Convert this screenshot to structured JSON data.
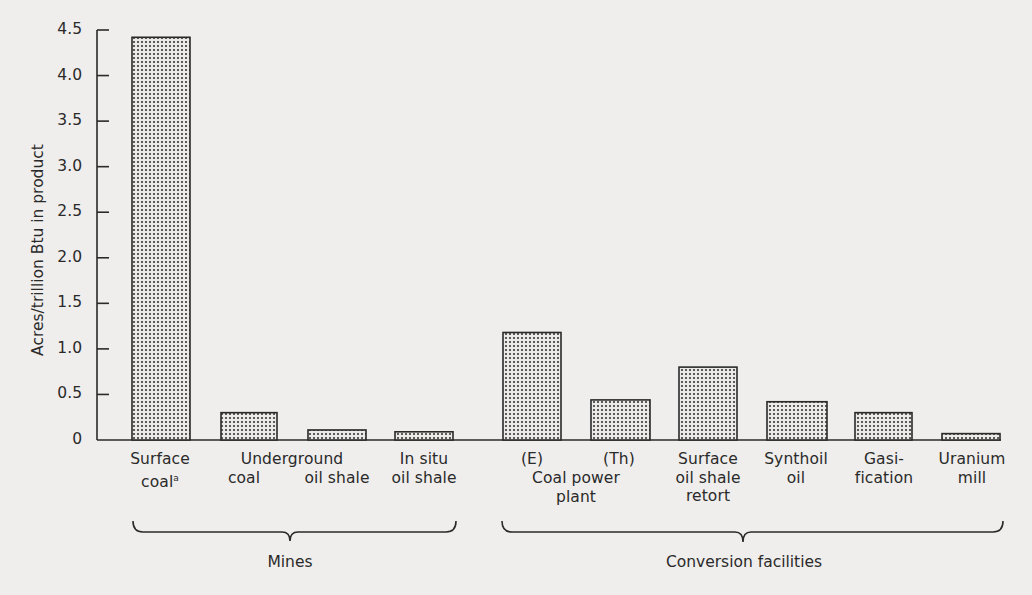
{
  "chart_data": {
    "type": "bar",
    "title": "",
    "xlabel": "",
    "ylabel": "Acres/trillion Btu in product",
    "ylim": [
      0,
      4.5
    ],
    "yticks": [
      "0",
      "0.5",
      "1.0",
      "1.5",
      "2.0",
      "2.5",
      "3.0",
      "3.5",
      "4.0",
      "4.5"
    ],
    "grid": false,
    "legend": null,
    "fill_pattern": "stippled dots",
    "categories": [
      "Surface coal^a",
      "Underground coal",
      "Underground oil shale",
      "In situ oil shale",
      "Coal power plant (E)",
      "Coal power plant (Th)",
      "Surface oil shale retort",
      "Synthoil oil",
      "Gasification",
      "Uranium mill"
    ],
    "values": [
      4.42,
      0.3,
      0.11,
      0.09,
      1.18,
      0.44,
      0.8,
      0.42,
      0.3,
      0.07
    ],
    "groups": [
      {
        "name": "Mines",
        "categories": [
          0,
          1,
          2,
          3
        ]
      },
      {
        "name": "Conversion facilities",
        "categories": [
          4,
          5,
          6,
          7,
          8,
          9
        ]
      }
    ],
    "footnote_marker": "a"
  },
  "axis": {
    "ylabel": "Acres/trillion Btu in product",
    "ticks": [
      {
        "label": "0",
        "value": 0
      },
      {
        "label": "0.5",
        "value": 0.5
      },
      {
        "label": "1.0",
        "value": 1.0
      },
      {
        "label": "1.5",
        "value": 1.5
      },
      {
        "label": "2.0",
        "value": 2.0
      },
      {
        "label": "2.5",
        "value": 2.5
      },
      {
        "label": "3.0",
        "value": 3.0
      },
      {
        "label": "3.5",
        "value": 3.5
      },
      {
        "label": "4.0",
        "value": 4.0
      },
      {
        "label": "4.5",
        "value": 4.5
      }
    ]
  },
  "labels": {
    "surface_coal_1": "Surface",
    "surface_coal_2": "coal",
    "surface_coal_sup": "a",
    "underground_1": "Underground",
    "underground_coal": "coal",
    "underground_oil_shale": "oil shale",
    "in_situ_1": "In situ",
    "in_situ_2": "oil shale",
    "e": "(E)",
    "th": "(Th)",
    "coal_power_1": "Coal power",
    "coal_power_2": "plant",
    "retort_1": "Surface",
    "retort_2": "oil shale",
    "retort_3": "retort",
    "synthoil_1": "Synthoil",
    "synthoil_2": "oil",
    "gasi_1": "Gasi-",
    "gasi_2": "fication",
    "uranium_1": "Uranium",
    "uranium_2": "mill"
  },
  "groups": {
    "mines": "Mines",
    "conversion": "Conversion facilities"
  },
  "colors": {
    "background": "#efeeec",
    "ink": "#2a2a2a",
    "dot": "#555555",
    "bar_fill": "#e4e3e1"
  }
}
